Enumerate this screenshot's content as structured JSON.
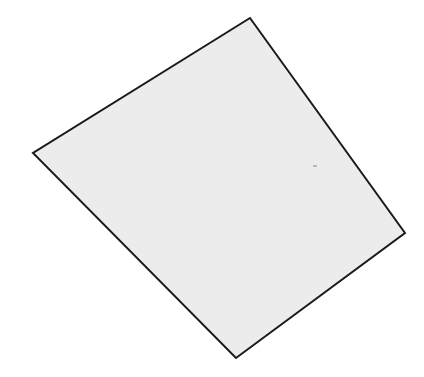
{
  "diagram": {
    "shape": "quadrilateral",
    "fill_color": "#ececec",
    "stroke_color": "#1a1a1a",
    "stroke_width": 2,
    "vertices": [
      {
        "name": "top",
        "x": 250,
        "y": 18
      },
      {
        "name": "right",
        "x": 405,
        "y": 233
      },
      {
        "name": "bottom",
        "x": 236,
        "y": 358
      },
      {
        "name": "left",
        "x": 33,
        "y": 153
      }
    ],
    "mark": {
      "x": 315,
      "y": 166,
      "color": "#888888"
    }
  }
}
